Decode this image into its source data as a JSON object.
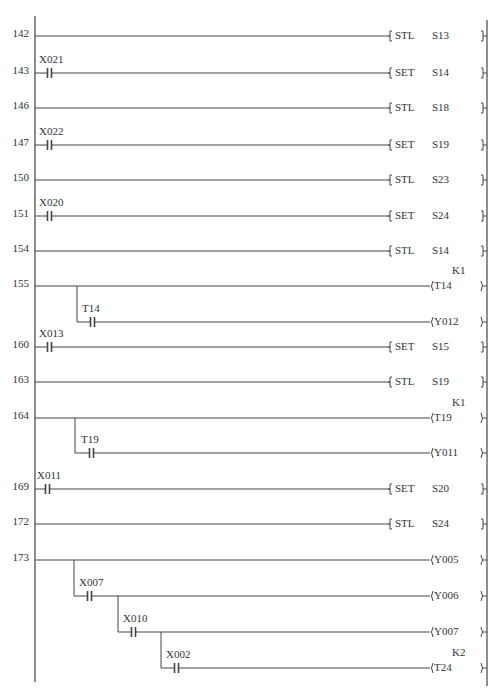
{
  "diagram": {
    "type": "ladder",
    "left_rail_x": 35,
    "right_rail_x": 487,
    "line_color": "#444444",
    "rungs": [
      {
        "step": "142",
        "y": 36,
        "contacts": [],
        "instruction": {
          "kind": "bracket",
          "op": "STL",
          "operand": "S13"
        }
      },
      {
        "step": "143",
        "y": 73,
        "contacts": [
          {
            "label": "X021",
            "x": 47
          }
        ],
        "instruction": {
          "kind": "bracket",
          "op": "SET",
          "operand": "S14"
        }
      },
      {
        "step": "146",
        "y": 108,
        "contacts": [],
        "instruction": {
          "kind": "bracket",
          "op": "STL",
          "operand": "S18"
        }
      },
      {
        "step": "147",
        "y": 145,
        "contacts": [
          {
            "label": "X022",
            "x": 47
          }
        ],
        "instruction": {
          "kind": "bracket",
          "op": "SET",
          "operand": "S19"
        }
      },
      {
        "step": "150",
        "y": 180,
        "contacts": [],
        "instruction": {
          "kind": "bracket",
          "op": "STL",
          "operand": "S23"
        }
      },
      {
        "step": "151",
        "y": 216,
        "contacts": [
          {
            "label": "X020",
            "x": 47
          }
        ],
        "instruction": {
          "kind": "bracket",
          "op": "SET",
          "operand": "S24"
        }
      },
      {
        "step": "154",
        "y": 251,
        "contacts": [],
        "instruction": {
          "kind": "bracket",
          "op": "STL",
          "operand": "S14"
        }
      },
      {
        "step": "155",
        "y": 286,
        "contacts": [],
        "instruction": {
          "kind": "coil",
          "operand": "T14",
          "constant": "K1"
        },
        "branches": [
          {
            "from_x": 77,
            "y": 322,
            "contacts": [
              {
                "label": "T14",
                "x": 90
              }
            ],
            "instruction": {
              "kind": "coil",
              "operand": "Y012"
            }
          }
        ]
      },
      {
        "step": "160",
        "y": 347,
        "contacts": [
          {
            "label": "X013",
            "x": 47
          }
        ],
        "instruction": {
          "kind": "bracket",
          "op": "SET",
          "operand": "S15"
        }
      },
      {
        "step": "163",
        "y": 382,
        "contacts": [],
        "instruction": {
          "kind": "bracket",
          "op": "STL",
          "operand": "S19"
        }
      },
      {
        "step": "164",
        "y": 418,
        "contacts": [],
        "instruction": {
          "kind": "coil",
          "operand": "T19",
          "constant": "K1"
        },
        "branches": [
          {
            "from_x": 75,
            "y": 453,
            "contacts": [
              {
                "label": "T19",
                "x": 89
              }
            ],
            "instruction": {
              "kind": "coil",
              "operand": "Y011"
            }
          }
        ]
      },
      {
        "step": "169",
        "y": 489,
        "contacts": [
          {
            "label": "X011",
            "x": 45
          }
        ],
        "instruction": {
          "kind": "bracket",
          "op": "SET",
          "operand": "S20"
        }
      },
      {
        "step": "172",
        "y": 524,
        "contacts": [],
        "instruction": {
          "kind": "bracket",
          "op": "STL",
          "operand": "S24"
        }
      },
      {
        "step": "173",
        "y": 560,
        "contacts": [],
        "instruction": {
          "kind": "coil",
          "operand": "Y005"
        },
        "branches": [
          {
            "from_x": 74,
            "y": 596,
            "contacts": [
              {
                "label": "X007",
                "x": 87
              }
            ],
            "instruction": {
              "kind": "coil",
              "operand": "Y006"
            }
          },
          {
            "from_x": 118,
            "y": 632,
            "contacts": [
              {
                "label": "X010",
                "x": 131
              }
            ],
            "instruction": {
              "kind": "coil",
              "operand": "Y007"
            }
          },
          {
            "from_x": 161,
            "y": 668,
            "contacts": [
              {
                "label": "X002",
                "x": 174
              }
            ],
            "instruction": {
              "kind": "coil",
              "operand": "T24",
              "constant": "K2"
            }
          }
        ]
      }
    ]
  }
}
